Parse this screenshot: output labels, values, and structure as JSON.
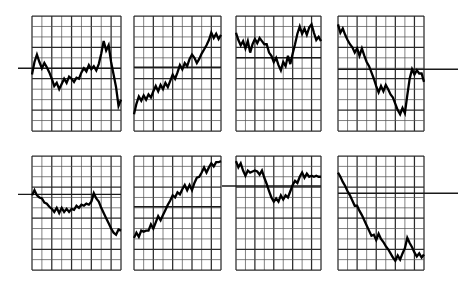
{
  "figure": {
    "title": "",
    "background_color": "#ffffff",
    "grid_color": "#555555",
    "grid_major_color": "#2b2b2b",
    "series_color": "#000000",
    "reference_line_color": "#1a1a1a",
    "panel_rows": 2,
    "panel_columns": 4,
    "panel_count": 8
  },
  "chart_data": [
    {
      "type": "line",
      "title": "",
      "xlabel": "",
      "ylabel": "",
      "panel_index": 1,
      "panel_name": "panel-1-peak-then-crash",
      "grid": {
        "columns": 9,
        "rows": 11,
        "show": true
      },
      "xlim": [
        0,
        9
      ],
      "ylim": [
        0,
        11
      ],
      "reference_line": {
        "y": 6.0,
        "extends_left": true,
        "extends_right": false
      },
      "x": [
        0.0,
        0.25,
        0.5,
        0.75,
        1.0,
        1.25,
        1.5,
        1.75,
        2.0,
        2.25,
        2.5,
        2.75,
        3.0,
        3.25,
        3.5,
        3.75,
        4.0,
        4.25,
        4.5,
        4.75,
        5.0,
        5.25,
        5.5,
        5.75,
        6.0,
        6.25,
        6.5,
        6.75,
        7.0,
        7.25,
        7.5,
        7.75,
        8.0,
        8.25,
        8.5,
        8.75,
        9.0
      ],
      "y": [
        5.4,
        6.6,
        7.3,
        6.6,
        6.0,
        6.5,
        6.1,
        5.6,
        5.0,
        4.3,
        4.6,
        4.0,
        4.5,
        5.0,
        4.6,
        5.2,
        5.0,
        4.7,
        5.1,
        5.0,
        5.6,
        6.0,
        5.7,
        6.3,
        5.9,
        6.2,
        5.8,
        6.4,
        7.4,
        8.6,
        7.7,
        8.2,
        6.6,
        5.4,
        4.2,
        2.4,
        3.0
      ]
    },
    {
      "type": "line",
      "title": "",
      "xlabel": "",
      "ylabel": "",
      "panel_index": 2,
      "panel_name": "panel-2-steady-uptrend",
      "grid": {
        "columns": 9,
        "rows": 11,
        "show": true
      },
      "xlim": [
        0,
        9
      ],
      "ylim": [
        0,
        11
      ],
      "reference_line": {
        "y": 6.1,
        "extends_left": false,
        "extends_right": false
      },
      "x": [
        0.0,
        0.25,
        0.5,
        0.75,
        1.0,
        1.25,
        1.5,
        1.75,
        2.0,
        2.25,
        2.5,
        2.75,
        3.0,
        3.25,
        3.5,
        3.75,
        4.0,
        4.25,
        4.5,
        4.75,
        5.0,
        5.25,
        5.5,
        5.75,
        6.0,
        6.25,
        6.5,
        6.75,
        7.0,
        7.25,
        7.5,
        7.75,
        8.0,
        8.25,
        8.5,
        8.75,
        9.0
      ],
      "y": [
        1.6,
        2.6,
        3.3,
        2.9,
        3.4,
        3.0,
        3.5,
        3.2,
        3.8,
        4.3,
        3.8,
        4.4,
        4.0,
        4.6,
        4.2,
        4.8,
        5.4,
        5.0,
        5.6,
        6.3,
        5.9,
        6.5,
        6.2,
        6.9,
        7.3,
        7.0,
        6.5,
        6.9,
        7.4,
        7.8,
        8.2,
        8.7,
        9.4,
        8.9,
        9.3,
        8.8,
        9.2
      ]
    },
    {
      "type": "line",
      "title": "",
      "xlabel": "",
      "ylabel": "",
      "panel_index": 3,
      "panel_name": "panel-3-dip-then-recovery",
      "grid": {
        "columns": 9,
        "rows": 11,
        "show": true
      },
      "xlim": [
        0,
        9
      ],
      "ylim": [
        0,
        11
      ],
      "reference_line": {
        "y": 7.0,
        "extends_left": false,
        "extends_right": false
      },
      "x": [
        0.0,
        0.25,
        0.5,
        0.75,
        1.0,
        1.25,
        1.5,
        1.75,
        2.0,
        2.25,
        2.5,
        2.75,
        3.0,
        3.25,
        3.5,
        3.75,
        4.0,
        4.25,
        4.5,
        4.75,
        5.0,
        5.25,
        5.5,
        5.75,
        6.0,
        6.25,
        6.5,
        6.75,
        7.0,
        7.25,
        7.5,
        7.75,
        8.0,
        8.25,
        8.5,
        8.75,
        9.0
      ],
      "y": [
        9.4,
        8.7,
        8.2,
        8.6,
        7.9,
        8.6,
        7.5,
        8.3,
        8.8,
        8.4,
        8.9,
        8.6,
        8.3,
        8.3,
        7.5,
        7.2,
        6.6,
        7.0,
        6.3,
        5.8,
        6.6,
        6.2,
        7.2,
        6.4,
        7.4,
        8.3,
        9.3,
        10.0,
        9.3,
        9.8,
        9.2,
        9.9,
        10.2,
        9.4,
        8.7,
        9.0,
        8.6
      ]
    },
    {
      "type": "line",
      "title": "",
      "xlabel": "",
      "ylabel": "",
      "panel_index": 4,
      "panel_name": "panel-4-downtrend-with-rebound",
      "grid": {
        "columns": 9,
        "rows": 11,
        "show": true
      },
      "xlim": [
        0,
        9
      ],
      "ylim": [
        0,
        11
      ],
      "reference_line": {
        "y": 5.9,
        "extends_left": false,
        "extends_right": true
      },
      "x": [
        0.0,
        0.25,
        0.5,
        0.75,
        1.0,
        1.25,
        1.5,
        1.75,
        2.0,
        2.25,
        2.5,
        2.75,
        3.0,
        3.25,
        3.5,
        3.75,
        4.0,
        4.25,
        4.5,
        4.75,
        5.0,
        5.25,
        5.5,
        5.75,
        6.0,
        6.25,
        6.5,
        6.75,
        7.0,
        7.25,
        7.5,
        7.75,
        8.0,
        8.25,
        8.5,
        8.75,
        9.0
      ],
      "y": [
        10.2,
        9.4,
        9.8,
        9.2,
        8.7,
        8.3,
        8.0,
        7.5,
        7.9,
        7.2,
        7.9,
        7.2,
        6.6,
        6.2,
        5.6,
        5.0,
        4.3,
        3.7,
        4.3,
        3.8,
        4.4,
        4.0,
        3.5,
        3.2,
        2.6,
        2.0,
        1.6,
        2.2,
        1.7,
        3.4,
        5.0,
        5.9,
        5.4,
        5.8,
        5.5,
        5.5,
        4.7
      ]
    },
    {
      "type": "line",
      "title": "",
      "xlabel": "",
      "ylabel": "",
      "panel_index": 5,
      "panel_name": "panel-5-gradual-decline",
      "grid": {
        "columns": 9,
        "rows": 11,
        "show": true
      },
      "xlim": [
        0,
        9
      ],
      "ylim": [
        0,
        11
      ],
      "reference_line": {
        "y": 7.3,
        "extends_left": true,
        "extends_right": false
      },
      "x": [
        0.0,
        0.25,
        0.5,
        0.75,
        1.0,
        1.25,
        1.5,
        1.75,
        2.0,
        2.25,
        2.5,
        2.75,
        3.0,
        3.25,
        3.5,
        3.75,
        4.0,
        4.25,
        4.5,
        4.75,
        5.0,
        5.25,
        5.5,
        5.75,
        6.0,
        6.25,
        6.5,
        6.75,
        7.0,
        7.25,
        7.5,
        7.75,
        8.0,
        8.25,
        8.5,
        8.75,
        9.0
      ],
      "y": [
        7.2,
        7.7,
        7.2,
        7.0,
        6.9,
        6.5,
        6.4,
        6.1,
        5.9,
        5.6,
        6.0,
        5.5,
        6.0,
        5.6,
        5.9,
        5.6,
        5.9,
        5.8,
        6.2,
        6.0,
        6.3,
        6.2,
        6.4,
        6.3,
        6.6,
        7.4,
        6.9,
        6.6,
        6.0,
        5.5,
        5.0,
        4.5,
        4.0,
        3.6,
        3.4,
        3.9,
        3.8
      ]
    },
    {
      "type": "line",
      "title": "",
      "xlabel": "",
      "ylabel": "",
      "panel_index": 6,
      "panel_name": "panel-6-strong-uptrend",
      "grid": {
        "columns": 9,
        "rows": 11,
        "show": true
      },
      "xlim": [
        0,
        9
      ],
      "ylim": [
        0,
        11
      ],
      "reference_line": {
        "y": 6.1,
        "extends_left": false,
        "extends_right": false
      },
      "x": [
        0.0,
        0.25,
        0.5,
        0.75,
        1.0,
        1.25,
        1.5,
        1.75,
        2.0,
        2.25,
        2.5,
        2.75,
        3.0,
        3.25,
        3.5,
        3.75,
        4.0,
        4.25,
        4.5,
        4.75,
        5.0,
        5.25,
        5.5,
        5.75,
        6.0,
        6.25,
        6.5,
        6.75,
        7.0,
        7.25,
        7.5,
        7.75,
        8.0,
        8.25,
        8.5,
        8.75,
        9.0
      ],
      "y": [
        3.1,
        3.6,
        3.2,
        3.8,
        3.7,
        3.8,
        3.8,
        4.4,
        4.0,
        4.6,
        5.2,
        4.8,
        5.3,
        5.8,
        6.3,
        6.7,
        7.2,
        7.0,
        7.5,
        7.3,
        7.8,
        8.2,
        7.7,
        8.2,
        7.7,
        8.4,
        8.9,
        9.0,
        9.4,
        9.9,
        9.4,
        9.9,
        10.3,
        10.0,
        10.4,
        10.4,
        10.5
      ]
    },
    {
      "type": "line",
      "title": "",
      "xlabel": "",
      "ylabel": "",
      "panel_index": 7,
      "panel_name": "panel-7-u-shape-dip",
      "grid": {
        "columns": 9,
        "rows": 11,
        "show": true
      },
      "xlim": [
        0,
        9
      ],
      "ylim": [
        0,
        11
      ],
      "reference_line": {
        "y": 8.1,
        "extends_left": true,
        "extends_right": false
      },
      "x": [
        0.0,
        0.25,
        0.5,
        0.75,
        1.0,
        1.25,
        1.5,
        1.75,
        2.0,
        2.25,
        2.5,
        2.75,
        3.0,
        3.25,
        3.5,
        3.75,
        4.0,
        4.25,
        4.5,
        4.75,
        5.0,
        5.25,
        5.5,
        5.75,
        6.0,
        6.25,
        6.5,
        6.75,
        7.0,
        7.25,
        7.5,
        7.75,
        8.0,
        8.25,
        8.5,
        8.75,
        9.0
      ],
      "y": [
        10.5,
        9.9,
        10.3,
        9.6,
        9.1,
        9.6,
        9.4,
        9.5,
        9.6,
        9.5,
        9.2,
        9.6,
        8.9,
        8.3,
        7.6,
        7.0,
        6.6,
        6.9,
        6.6,
        7.2,
        6.8,
        7.2,
        7.0,
        7.6,
        8.2,
        8.6,
        8.4,
        9.0,
        9.4,
        8.9,
        9.3,
        9.0,
        9.1,
        9.0,
        9.1,
        9.0,
        9.0
      ]
    },
    {
      "type": "line",
      "title": "",
      "xlabel": "",
      "ylabel": "",
      "panel_index": 8,
      "panel_name": "panel-8-steady-downtrend",
      "grid": {
        "columns": 9,
        "rows": 11,
        "show": true
      },
      "xlim": [
        0,
        9
      ],
      "ylim": [
        0,
        11
      ],
      "reference_line": {
        "y": 7.4,
        "extends_left": false,
        "extends_right": true
      },
      "x": [
        0.0,
        0.25,
        0.5,
        0.75,
        1.0,
        1.25,
        1.5,
        1.75,
        2.0,
        2.25,
        2.5,
        2.75,
        3.0,
        3.25,
        3.5,
        3.75,
        4.0,
        4.25,
        4.5,
        4.75,
        5.0,
        5.25,
        5.5,
        5.75,
        6.0,
        6.25,
        6.5,
        6.75,
        7.0,
        7.25,
        7.5,
        7.75,
        8.0,
        8.25,
        8.5,
        8.75,
        9.0
      ],
      "y": [
        9.4,
        9.0,
        8.5,
        8.1,
        7.6,
        7.2,
        6.7,
        6.2,
        6.2,
        5.7,
        5.3,
        4.8,
        4.3,
        3.8,
        3.3,
        3.4,
        2.9,
        3.5,
        3.0,
        2.7,
        2.3,
        2.0,
        1.6,
        1.2,
        0.9,
        1.4,
        1.0,
        1.6,
        2.1,
        3.1,
        2.6,
        2.2,
        1.7,
        1.3,
        1.6,
        1.2,
        1.5
      ]
    }
  ],
  "panel_layout": [
    {
      "x": 32,
      "y": 16,
      "w": 89,
      "h": 115
    },
    {
      "x": 134,
      "y": 16,
      "w": 87,
      "h": 115
    },
    {
      "x": 236,
      "y": 16,
      "w": 85,
      "h": 115
    },
    {
      "x": 338,
      "y": 16,
      "w": 86,
      "h": 115
    },
    {
      "x": 32,
      "y": 156,
      "w": 89,
      "h": 114
    },
    {
      "x": 134,
      "y": 156,
      "w": 87,
      "h": 114
    },
    {
      "x": 236,
      "y": 156,
      "w": 85,
      "h": 114
    },
    {
      "x": 338,
      "y": 156,
      "w": 86,
      "h": 114
    }
  ]
}
